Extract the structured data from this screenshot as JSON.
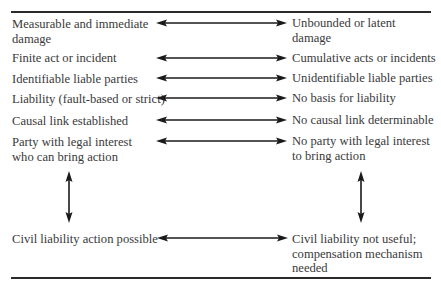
{
  "diagram": {
    "rows": [
      {
        "left": "Measurable and immediate damage",
        "right": "Unbounded or latent damage",
        "y": 23
      },
      {
        "left": "Finite act or incident",
        "right": "Cumulative acts or incidents",
        "y": 58
      },
      {
        "left": "Identifiable liable parties",
        "right": "Unidentifiable liable parties",
        "y": 78
      },
      {
        "left": "Liability (fault-based or strict)",
        "right": "No basis for liability",
        "y": 98
      },
      {
        "left": "Causal link established",
        "right": "No causal link determinable",
        "y": 120
      },
      {
        "left": "Party with legal interest who can bring action",
        "right": "No party with legal interest to bring action",
        "y": 141
      }
    ],
    "outcome": {
      "left": "Civil liability action possible",
      "right": "Civil liability not useful; compensation mechanism needed",
      "y": 239
    },
    "arrow_color": "#1a1a1a",
    "rule_color": "#2a2a2a"
  }
}
